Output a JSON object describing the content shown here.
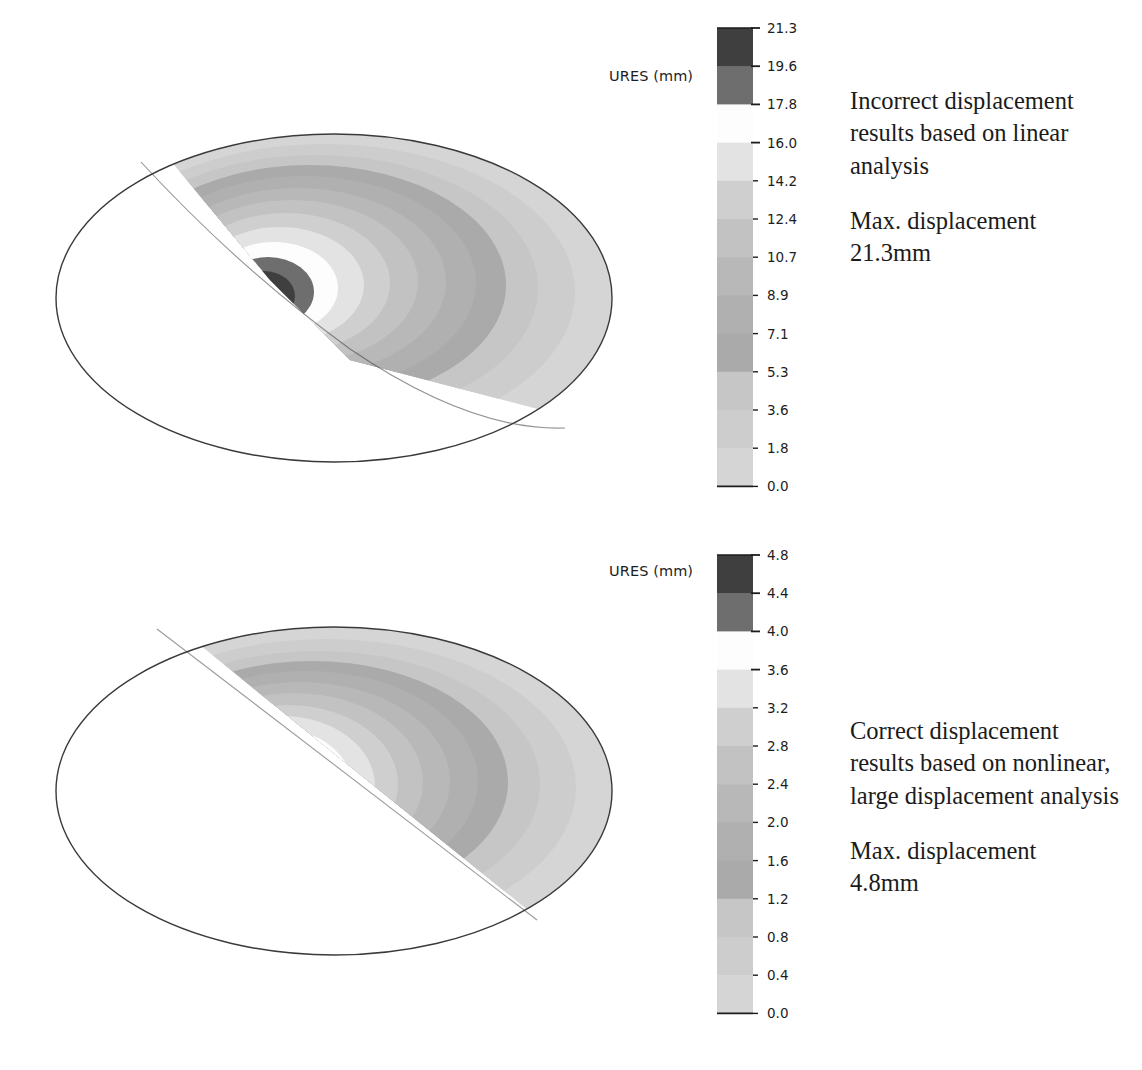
{
  "figure": {
    "type": "fea-contour-comparison",
    "background": "#ffffff"
  },
  "palette": {
    "band_colors": [
      "#3f3f3f",
      "#6e6e6e",
      "#fdfdfd",
      "#e3e3e3",
      "#cfcfcf",
      "#c2c2c2",
      "#b8b8b8",
      "#b0b0b0",
      "#aaaaaa",
      "#c6c6c6",
      "#cdcdcd",
      "#d5d5d5"
    ],
    "outline": "#3a3a3a",
    "text": "#1b1b1b"
  },
  "panels": [
    {
      "id": "top",
      "legend": {
        "title": "URES (mm)",
        "tick_labels": [
          "21.3",
          "19.6",
          "17.8",
          "16.0",
          "14.2",
          "12.4",
          "10.7",
          "8.9",
          "7.1",
          "5.3",
          "3.6",
          "1.8",
          "0.0"
        ]
      },
      "annotation": {
        "description": "Incorrect displacement results based on linear analysis",
        "max_label": "Max. displacement",
        "max_value": "21.3mm"
      }
    },
    {
      "id": "bottom",
      "legend": {
        "title": "URES (mm)",
        "tick_labels": [
          "4.8",
          "4.4",
          "4.0",
          "3.6",
          "3.2",
          "2.8",
          "2.4",
          "2.0",
          "1.6",
          "1.2",
          "0.8",
          "0.4",
          "0.0"
        ]
      },
      "annotation": {
        "description": "Correct displacement results based on nonlinear, large displacement analysis",
        "max_label": "Max. displacement",
        "max_value": "4.8mm"
      }
    }
  ],
  "chart_data": [
    {
      "type": "heatmap",
      "title": "URES (mm)",
      "subtitle": "Incorrect displacement results based on linear analysis",
      "legend_position": "right",
      "grid": false,
      "xlabel": "",
      "ylabel": "",
      "colorbar": {
        "label": "URES (mm)",
        "units": "mm",
        "ticks": [
          21.3,
          19.6,
          17.8,
          16.0,
          14.2,
          12.4,
          10.7,
          8.9,
          7.1,
          5.3,
          3.6,
          1.8,
          0.0
        ],
        "tick_labels": [
          "21.3",
          "19.6",
          "17.8",
          "16.0",
          "14.2",
          "12.4",
          "10.7",
          "8.9",
          "7.1",
          "5.3",
          "3.6",
          "1.8",
          "0.0"
        ],
        "range": [
          0.0,
          21.3
        ],
        "n_bands": 12
      },
      "max_value": 21.3,
      "min_value": 0.0,
      "annotation": "Max. displacement 21.3mm"
    },
    {
      "type": "heatmap",
      "title": "URES (mm)",
      "subtitle": "Correct displacement results based on nonlinear, large displacement analysis",
      "legend_position": "right",
      "grid": false,
      "xlabel": "",
      "ylabel": "",
      "colorbar": {
        "label": "URES (mm)",
        "units": "mm",
        "ticks": [
          4.8,
          4.4,
          4.0,
          3.6,
          3.2,
          2.8,
          2.4,
          2.0,
          1.6,
          1.2,
          0.8,
          0.4,
          0.0
        ],
        "tick_labels": [
          "4.8",
          "4.4",
          "4.0",
          "3.6",
          "3.2",
          "2.8",
          "2.4",
          "2.0",
          "1.6",
          "1.2",
          "0.8",
          "0.4",
          "0.0"
        ],
        "range": [
          0.0,
          4.8
        ],
        "n_bands": 12
      },
      "max_value": 4.8,
      "min_value": 0.0,
      "annotation": "Max. displacement 4.8mm"
    }
  ]
}
